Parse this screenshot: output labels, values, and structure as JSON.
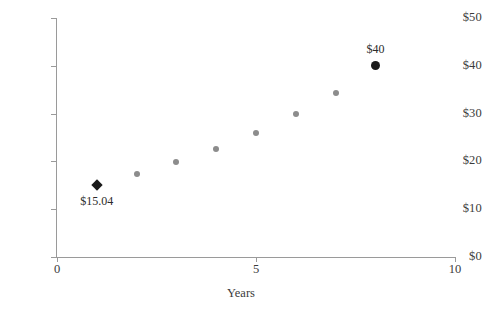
{
  "chart_data": {
    "type": "scatter",
    "title": "",
    "xlabel": "Years",
    "ylabel": "",
    "xlim": [
      0,
      10
    ],
    "ylim": [
      0,
      50
    ],
    "grid": false,
    "legend": "none",
    "x_ticks": [
      "0",
      "5",
      "10"
    ],
    "x_tick_values": [
      0,
      5,
      10
    ],
    "y_ticks": [
      "$0",
      "$10",
      "$20",
      "$30",
      "$40",
      "$50"
    ],
    "y_tick_values": [
      0,
      10,
      20,
      30,
      40,
      50
    ],
    "x": [
      1,
      2,
      3,
      4,
      5,
      6,
      7,
      8
    ],
    "values": [
      15.04,
      17.4,
      19.9,
      22.6,
      26.0,
      30.0,
      34.4,
      40.0
    ],
    "points": [
      {
        "x": 1,
        "y": 15.04,
        "marker": "diamond",
        "color": "#1a1a1a",
        "label": "$15.04",
        "label_pos": "below"
      },
      {
        "x": 2,
        "y": 17.4,
        "marker": "circle",
        "color": "#8c8c8c",
        "label": "",
        "label_pos": ""
      },
      {
        "x": 3,
        "y": 19.9,
        "marker": "circle",
        "color": "#8c8c8c",
        "label": "",
        "label_pos": ""
      },
      {
        "x": 4,
        "y": 22.6,
        "marker": "circle",
        "color": "#8c8c8c",
        "label": "",
        "label_pos": ""
      },
      {
        "x": 5,
        "y": 26.0,
        "marker": "circle",
        "color": "#8c8c8c",
        "label": "",
        "label_pos": ""
      },
      {
        "x": 6,
        "y": 30.0,
        "marker": "circle",
        "color": "#8c8c8c",
        "label": "",
        "label_pos": ""
      },
      {
        "x": 7,
        "y": 34.4,
        "marker": "circle",
        "color": "#8c8c8c",
        "label": "",
        "label_pos": ""
      },
      {
        "x": 8,
        "y": 40.0,
        "marker": "circle-large",
        "color": "#1a1a1a",
        "label": "$40",
        "label_pos": "above"
      }
    ],
    "annotations": [
      {
        "text": "$15.04",
        "for_point": 0
      },
      {
        "text": "$40",
        "for_point": 7
      }
    ],
    "colors": {
      "series_gray": "#8c8c8c",
      "highlight_dark": "#1a1a1a",
      "axis": "#9a9a9a",
      "text": "#3b3b3b",
      "background": "#ffffff"
    }
  }
}
